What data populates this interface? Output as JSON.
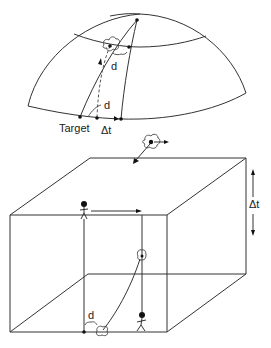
{
  "figure": {
    "top_panel": {
      "description": "Hemisphere (globe cap) with meridians and latitude line",
      "labels": {
        "target": "Target",
        "delta_t": "Δt",
        "distance_upper": "d",
        "distance_lower": "d"
      }
    },
    "connector": {
      "description": "Cloud-like object with dot and two arrows"
    },
    "bottom_panel": {
      "description": "3D box (space-time cube) with two person figures and trajectory",
      "labels": {
        "delta_t": "Δt",
        "distance": "d"
      }
    },
    "colors": {
      "line": "#333333",
      "text": "#222222",
      "background": "#ffffff"
    }
  }
}
